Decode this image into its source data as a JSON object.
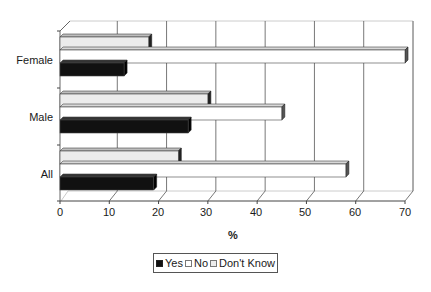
{
  "chart_data": {
    "type": "bar",
    "orientation": "horizontal",
    "style": "3d-clustered",
    "title": "",
    "xlabel": "%",
    "ylabel": "",
    "xlim": [
      0,
      70
    ],
    "x_ticks": [
      0,
      10,
      20,
      30,
      40,
      50,
      60,
      70
    ],
    "grid": true,
    "legend_position": "bottom",
    "categories": [
      "All",
      "Male",
      "Female"
    ],
    "series": [
      {
        "name": "Yes",
        "color": "#111111",
        "values": [
          19,
          26,
          13
        ]
      },
      {
        "name": "No",
        "color": "#ffffff",
        "values": [
          58,
          45,
          70
        ]
      },
      {
        "name": "Don't Know",
        "color": "#ececec",
        "values": [
          24,
          30,
          18
        ]
      }
    ]
  },
  "labels": {
    "categories_top_to_bottom": [
      "Female",
      "Male",
      "All"
    ],
    "ticks": [
      "0",
      "10",
      "20",
      "30",
      "40",
      "50",
      "60",
      "70"
    ],
    "axis_title": "%",
    "legend": [
      "Yes",
      "No",
      "Don't Know"
    ]
  }
}
